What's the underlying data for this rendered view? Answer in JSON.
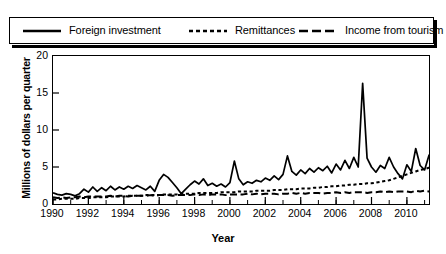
{
  "chart_data": {
    "type": "line",
    "title": "",
    "xlabel": "Year",
    "ylabel": "Millions of dollars per quarter",
    "xlim": [
      1990,
      2011.25
    ],
    "ylim": [
      0,
      20
    ],
    "yticks": [
      0,
      5,
      10,
      15,
      20
    ],
    "xticks": [
      1990,
      1992,
      1994,
      1996,
      1998,
      2000,
      2002,
      2004,
      2006,
      2008,
      2010
    ],
    "grid": false,
    "legend_position": "above-plot",
    "x_unit": "quarter",
    "x_start": 1990,
    "x_step": 0.25,
    "series": [
      {
        "name": "Foreign investment",
        "style": "solid",
        "values": [
          1.5,
          1.3,
          1.2,
          1.4,
          1.3,
          1.1,
          1.4,
          2.0,
          1.6,
          2.3,
          1.7,
          2.2,
          1.8,
          2.4,
          1.9,
          2.3,
          2.0,
          2.4,
          2.1,
          2.5,
          2.2,
          1.9,
          2.4,
          1.7,
          3.2,
          4.0,
          3.6,
          2.9,
          2.2,
          1.4,
          2.0,
          2.6,
          3.1,
          2.7,
          3.4,
          2.5,
          2.8,
          2.4,
          2.7,
          2.3,
          2.9,
          5.8,
          3.4,
          2.6,
          3.0,
          2.8,
          3.2,
          3.0,
          3.5,
          3.2,
          3.8,
          3.3,
          4.0,
          6.5,
          4.4,
          3.9,
          4.6,
          4.1,
          4.8,
          4.3,
          4.9,
          4.5,
          5.1,
          4.2,
          5.4,
          4.6,
          5.9,
          4.8,
          6.3,
          5.0,
          16.3,
          6.2,
          5.0,
          4.3,
          5.2,
          4.8,
          6.3,
          5.0,
          4.1,
          3.4,
          5.3,
          4.4,
          7.5,
          5.2,
          4.6,
          6.6,
          5.5,
          4.9,
          5.4,
          6.3,
          5.7,
          5.1,
          6.0,
          5.4,
          6.4,
          2.4,
          10.2,
          6.1,
          6.8,
          7.4,
          6.9,
          7.2,
          7.0,
          6.6,
          6.8,
          6.2,
          5.4,
          4.7,
          4.2,
          3.1,
          2.9,
          6.8,
          4.0,
          3.0,
          7.4,
          6.0,
          5.1,
          3.2,
          4.9,
          2.4
        ]
      },
      {
        "name": "Remittances",
        "style": "dotted",
        "values": [
          0.6,
          0.6,
          0.7,
          0.7,
          0.7,
          0.7,
          0.8,
          0.8,
          0.8,
          0.9,
          0.9,
          0.9,
          0.9,
          1.0,
          1.0,
          1.0,
          1.0,
          1.1,
          1.1,
          1.1,
          1.1,
          1.2,
          1.2,
          1.2,
          1.2,
          1.3,
          1.3,
          1.3,
          1.3,
          1.4,
          1.4,
          1.4,
          1.4,
          1.5,
          1.5,
          1.5,
          1.5,
          1.5,
          1.6,
          1.6,
          1.6,
          1.6,
          1.7,
          1.7,
          1.7,
          1.7,
          1.8,
          1.8,
          1.8,
          1.8,
          1.9,
          1.9,
          1.9,
          2.0,
          2.0,
          2.0,
          2.1,
          2.1,
          2.1,
          2.2,
          2.2,
          2.3,
          2.3,
          2.4,
          2.4,
          2.5,
          2.5,
          2.6,
          2.6,
          2.7,
          2.7,
          2.8,
          2.8,
          2.9,
          3.0,
          3.1,
          3.2,
          3.4,
          3.6,
          3.8,
          4.0,
          4.2,
          4.4,
          4.6,
          4.7,
          4.9,
          5.0,
          5.2,
          5.4,
          5.5,
          5.7,
          5.8,
          5.9,
          6.0,
          6.2,
          6.3,
          6.4,
          6.5,
          6.6,
          6.8,
          6.9,
          6.8,
          6.6,
          6.4,
          6.2,
          6.1,
          6.0,
          6.0,
          5.9,
          5.8,
          5.7,
          5.7,
          5.6,
          5.6,
          5.7,
          5.8,
          5.8,
          5.9,
          6.0,
          6.0
        ]
      },
      {
        "name": "Income from tourism",
        "style": "dashed",
        "values": [
          0.9,
          0.8,
          0.9,
          0.8,
          0.9,
          0.9,
          1.0,
          0.9,
          1.0,
          1.0,
          1.0,
          1.0,
          1.0,
          1.1,
          1.0,
          1.1,
          1.1,
          1.0,
          1.1,
          1.1,
          1.1,
          1.1,
          1.2,
          1.1,
          1.2,
          1.2,
          1.2,
          1.1,
          1.2,
          1.2,
          1.2,
          1.2,
          1.3,
          1.2,
          1.3,
          1.2,
          1.3,
          1.3,
          1.3,
          1.2,
          1.3,
          1.3,
          1.3,
          1.3,
          1.4,
          1.3,
          1.4,
          1.3,
          1.4,
          1.4,
          1.4,
          1.3,
          1.4,
          1.4,
          1.5,
          1.4,
          1.5,
          1.4,
          1.5,
          1.5,
          1.5,
          1.4,
          1.5,
          1.5,
          1.6,
          1.5,
          1.6,
          1.5,
          1.6,
          1.6,
          1.6,
          1.5,
          1.6,
          1.6,
          1.7,
          1.6,
          1.7,
          1.6,
          1.7,
          1.7,
          1.7,
          1.6,
          1.8,
          1.7,
          1.8,
          1.7,
          1.8,
          1.8,
          1.9,
          1.7,
          1.9,
          1.8,
          1.9,
          1.8,
          2.0,
          1.8,
          2.0,
          1.9,
          2.0,
          1.9,
          2.1,
          1.9,
          2.1,
          2.0,
          2.1,
          1.9,
          2.0,
          1.8,
          1.9,
          1.5,
          1.2,
          1.6,
          1.9,
          1.7,
          2.0,
          1.9,
          2.1,
          1.9,
          2.0,
          1.4
        ]
      }
    ]
  },
  "legend": {
    "items": [
      {
        "label": "Foreign investment",
        "icon": "solid-line-icon"
      },
      {
        "label": "Remittances",
        "icon": "dotted-line-icon"
      },
      {
        "label": "Income from tourism",
        "icon": "dashed-line-icon"
      }
    ]
  },
  "axes": {
    "y_title": "Millions of dollars per quarter",
    "x_title": "Year",
    "y_tick_labels": [
      "0",
      "5",
      "10",
      "15",
      "20"
    ],
    "x_tick_labels": [
      "1990",
      "1992",
      "1994",
      "1996",
      "1998",
      "2000",
      "2002",
      "2004",
      "2006",
      "2008",
      "2010"
    ]
  },
  "colors": {
    "line": "#000000",
    "background": "#ffffff",
    "frame": "#000000"
  }
}
